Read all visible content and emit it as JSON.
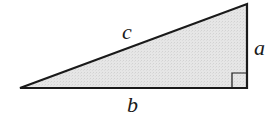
{
  "diagram": {
    "type": "right-triangle",
    "vertices": {
      "left": [
        20,
        88
      ],
      "top_right": [
        247,
        4
      ],
      "bottom_right": [
        247,
        88
      ]
    },
    "fill_color": "#e4e4e4",
    "stroke_color": "#1a1a1a",
    "right_angle_marker_size": 15,
    "labels": {
      "hypotenuse": "c",
      "vertical_leg": "a",
      "horizontal_leg": "b"
    }
  }
}
